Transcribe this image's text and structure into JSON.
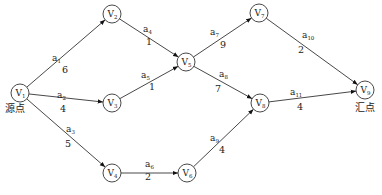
{
  "nodes": [
    {
      "id": "v1",
      "letter": "V",
      "index": "1"
    },
    {
      "id": "v2",
      "letter": "V",
      "index": "2"
    },
    {
      "id": "v3",
      "letter": "V",
      "index": "3"
    },
    {
      "id": "v4",
      "letter": "V",
      "index": "4"
    },
    {
      "id": "v5",
      "letter": "V",
      "index": "5"
    },
    {
      "id": "v6",
      "letter": "V",
      "index": "6"
    },
    {
      "id": "v7",
      "letter": "V",
      "index": "7"
    },
    {
      "id": "v8",
      "letter": "V",
      "index": "8"
    },
    {
      "id": "v9",
      "letter": "V",
      "index": "9"
    }
  ],
  "edges": [
    {
      "from": "v1",
      "to": "v2",
      "letter": "a",
      "index": "1",
      "weight": "6"
    },
    {
      "from": "v1",
      "to": "v3",
      "letter": "a",
      "index": "2",
      "weight": "4"
    },
    {
      "from": "v1",
      "to": "v4",
      "letter": "a",
      "index": "3",
      "weight": "5"
    },
    {
      "from": "v2",
      "to": "v5",
      "letter": "a",
      "index": "4",
      "weight": "1"
    },
    {
      "from": "v3",
      "to": "v5",
      "letter": "a",
      "index": "5",
      "weight": "1"
    },
    {
      "from": "v4",
      "to": "v6",
      "letter": "a",
      "index": "6",
      "weight": "2"
    },
    {
      "from": "v5",
      "to": "v7",
      "letter": "a",
      "index": "7",
      "weight": "9"
    },
    {
      "from": "v5",
      "to": "v8",
      "letter": "a",
      "index": "8",
      "weight": "7"
    },
    {
      "from": "v6",
      "to": "v8",
      "letter": "a",
      "index": "9",
      "weight": "4"
    },
    {
      "from": "v7",
      "to": "v9",
      "letter": "a",
      "index": "10",
      "weight": "2"
    },
    {
      "from": "v8",
      "to": "v9",
      "letter": "a",
      "index": "11",
      "weight": "4"
    }
  ],
  "labels": {
    "source": "源点",
    "sink": "汇点"
  }
}
